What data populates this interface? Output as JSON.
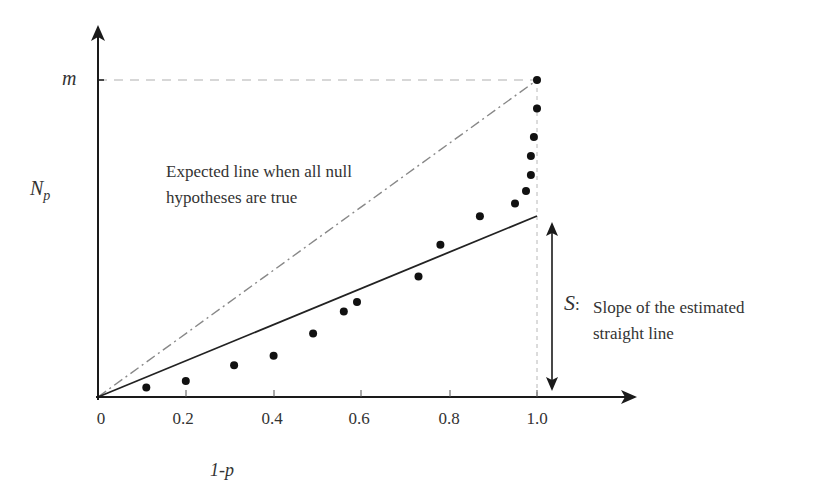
{
  "chart_data": {
    "type": "scatter",
    "title": "",
    "xlabel": "1-p",
    "ylabel": "N_p",
    "ylabel_main": "N",
    "ylabel_sub": "p",
    "xlim": [
      0,
      1.2
    ],
    "ylim": [
      0,
      1.15
    ],
    "x_ticks": [
      0,
      0.2,
      0.4,
      0.6,
      0.8,
      1.0
    ],
    "x_tick_labels": [
      "0",
      "0.2",
      "0.4",
      "0.6",
      "0.8",
      "1.0"
    ],
    "y_tick_labels": [
      "m"
    ],
    "y_tick_values": [
      1.0
    ],
    "grid": false,
    "series": [
      {
        "name": "observed points",
        "type": "scatter",
        "x": [
          0.11,
          0.2,
          0.31,
          0.4,
          0.49,
          0.56,
          0.59,
          0.73,
          0.78,
          0.87,
          0.95,
          0.975,
          0.986,
          0.986,
          0.993,
          1.0,
          1.0
        ],
        "y": [
          0.03,
          0.05,
          0.1,
          0.13,
          0.2,
          0.27,
          0.3,
          0.38,
          0.48,
          0.57,
          0.61,
          0.65,
          0.7,
          0.76,
          0.82,
          0.91,
          1.0
        ]
      },
      {
        "name": "Expected line when all null hypotheses are true",
        "type": "line",
        "style": "dash-dot",
        "x": [
          0,
          1.0
        ],
        "y": [
          0,
          1.0
        ]
      },
      {
        "name": "Estimated straight line",
        "type": "line",
        "style": "solid",
        "x": [
          0,
          1.0
        ],
        "y": [
          0,
          0.57
        ]
      }
    ],
    "annotations": [
      {
        "text": "Expected line when all null hypotheses are true",
        "lines": [
          "Expected line when all null",
          "hypotheses are true"
        ]
      },
      {
        "symbol": "S",
        "text": "Slope of the estimated straight line",
        "lines": [
          "Slope of the estimated",
          "straight line"
        ]
      }
    ],
    "reference_lines": [
      {
        "type": "horizontal-dashed",
        "y": 1.0,
        "label": "m"
      },
      {
        "type": "vertical-dashed",
        "x": 1.0
      }
    ]
  },
  "labels": {
    "m": "m",
    "ylabel_main": "N",
    "ylabel_sub": "p",
    "xlabel": "1-p",
    "expected_line1": "Expected line when all null",
    "expected_line2": "hypotheses are true",
    "s_symbol": "S",
    "s_colon": ":",
    "s_line1": "Slope of the estimated",
    "s_line2": "straight line",
    "ticks": [
      "0",
      "0.2",
      "0.4",
      "0.6",
      "0.8",
      "1.0"
    ]
  },
  "colors": {
    "axis": "#1a1a1a",
    "points": "#111111",
    "dashed_ref": "#b0b0b0",
    "dashdot_line": "#888888",
    "fit_line": "#222222",
    "text": "#333333"
  }
}
